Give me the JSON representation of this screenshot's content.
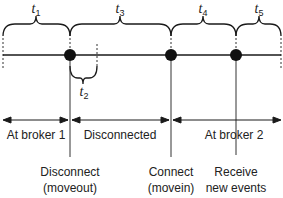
{
  "diagram": {
    "type": "timeline",
    "intervals_top": [
      {
        "id": "t1",
        "base": "t",
        "sub": "1",
        "x_start": 3,
        "x_end": 70
      },
      {
        "id": "t3",
        "base": "t",
        "sub": "3",
        "x_start": 70,
        "x_end": 171
      },
      {
        "id": "t4",
        "base": "t",
        "sub": "4",
        "x_start": 171,
        "x_end": 236
      },
      {
        "id": "t5",
        "base": "t",
        "sub": "5",
        "x_start": 236,
        "x_end": 281
      }
    ],
    "intervals_bottom": [
      {
        "id": "t2",
        "base": "t",
        "sub": "2",
        "x_start": 70,
        "x_end": 97
      }
    ],
    "events": [
      {
        "id": "disconnect",
        "x": 70,
        "line1": "Disconnect",
        "line2": "(moveout)"
      },
      {
        "id": "connect",
        "x": 171,
        "line1": "Connect",
        "line2": "(movein)"
      },
      {
        "id": "receive",
        "x": 236,
        "line1": "Receive",
        "line2": "new events"
      }
    ],
    "phases": [
      {
        "id": "broker1",
        "label": "At broker 1",
        "x_start": 3,
        "x_end": 70
      },
      {
        "id": "disconnected",
        "label": "Disconnected",
        "x_start": 70,
        "x_end": 171
      },
      {
        "id": "broker2",
        "label": "At broker 2",
        "x_start": 171,
        "x_end": 281
      }
    ],
    "colors": {
      "line": "#1a1a1a",
      "dot": "#111111",
      "text": "#222222"
    }
  }
}
